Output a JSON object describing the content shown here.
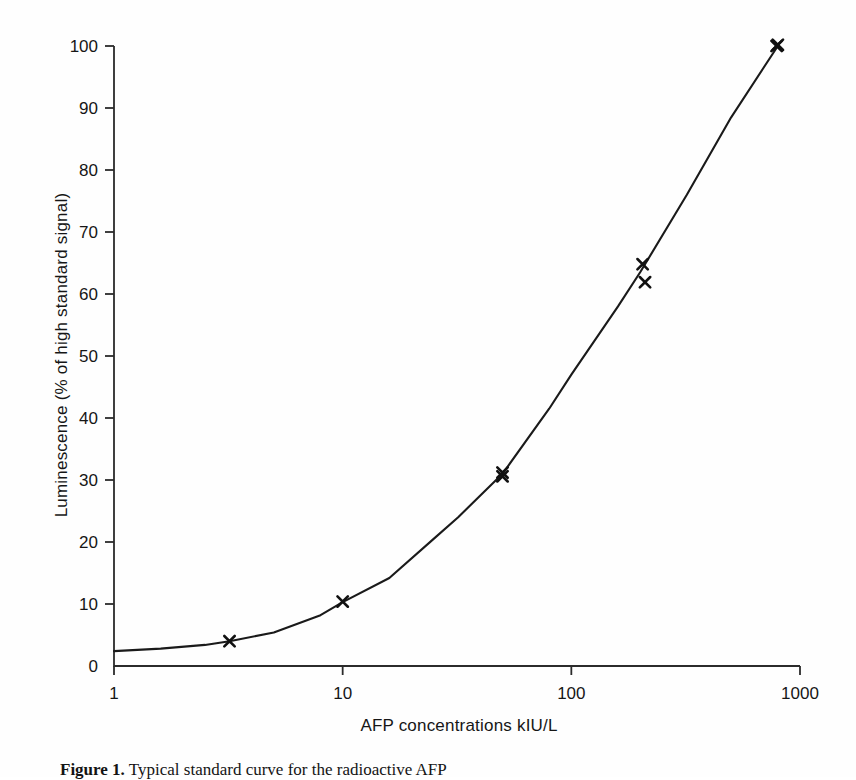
{
  "figure": {
    "caption_label": "Figure 1.",
    "caption_text": "Typical standard curve for the radioactive AFP"
  },
  "chart_data": {
    "type": "line",
    "title": "",
    "subtitle": "",
    "xlabel": "AFP concentrations kIU/L",
    "ylabel": "Luminescence (% of high standard signal)",
    "xscale": "log",
    "yscale": "linear",
    "xlim": [
      1,
      1000
    ],
    "ylim": [
      0,
      100
    ],
    "grid": false,
    "legend": null,
    "x_ticks": [
      1,
      10,
      100,
      1000
    ],
    "x_tick_labels": [
      "1",
      "10",
      "100",
      "1000"
    ],
    "y_ticks": [
      0,
      10,
      20,
      30,
      40,
      50,
      60,
      70,
      80,
      90,
      100
    ],
    "y_tick_labels": [
      "0",
      "10",
      "20",
      "30",
      "40",
      "50",
      "60",
      "70",
      "80",
      "90",
      "100"
    ],
    "series": [
      {
        "name": "fitted standard curve",
        "kind": "line",
        "x": [
          1,
          1.6,
          2.5,
          3.2,
          5,
          8,
          10,
          16,
          25,
          32,
          50,
          80,
          100,
          160,
          200,
          320,
          500,
          800
        ],
        "y": [
          2.4,
          2.8,
          3.4,
          4.0,
          5.4,
          8.2,
          10.3,
          14.2,
          20.5,
          24.0,
          31.0,
          41.5,
          47.0,
          58.0,
          63.5,
          76.0,
          88.5,
          100.0
        ]
      },
      {
        "name": "measured standards",
        "kind": "scatter",
        "marker": "x",
        "points": [
          {
            "x": 3.2,
            "y": 4.0
          },
          {
            "x": 10,
            "y": 10.4
          },
          {
            "x": 50,
            "y": 30.6
          },
          {
            "x": 50,
            "y": 31.2
          },
          {
            "x": 205,
            "y": 64.8
          },
          {
            "x": 210,
            "y": 61.9
          },
          {
            "x": 790,
            "y": 100.0
          },
          {
            "x": 800,
            "y": 100.2
          }
        ]
      }
    ],
    "colors": {
      "curve": "#1a1a1a",
      "marker": "#111111",
      "axis": "#2b2b2b",
      "background": "#fefefe"
    }
  }
}
